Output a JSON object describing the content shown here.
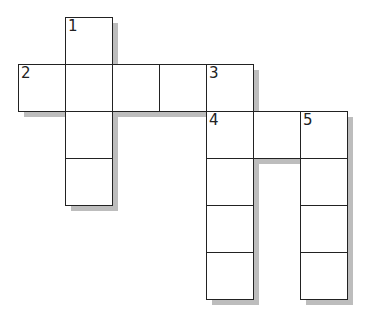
{
  "puzzle": {
    "type": "crossword",
    "cell_size": 47,
    "origin": {
      "x": 18,
      "y": 17
    },
    "colors": {
      "border": "#222222",
      "shadow": "#bdbdbd",
      "cell": "#ffffff"
    },
    "cells": [
      {
        "col": 1,
        "row": 0,
        "number": "1"
      },
      {
        "col": 0,
        "row": 1,
        "number": "2"
      },
      {
        "col": 1,
        "row": 1,
        "number": ""
      },
      {
        "col": 2,
        "row": 1,
        "number": ""
      },
      {
        "col": 3,
        "row": 1,
        "number": ""
      },
      {
        "col": 4,
        "row": 1,
        "number": "3"
      },
      {
        "col": 1,
        "row": 2,
        "number": ""
      },
      {
        "col": 1,
        "row": 3,
        "number": ""
      },
      {
        "col": 4,
        "row": 2,
        "number": "4"
      },
      {
        "col": 5,
        "row": 2,
        "number": ""
      },
      {
        "col": 6,
        "row": 2,
        "number": "5"
      },
      {
        "col": 4,
        "row": 3,
        "number": ""
      },
      {
        "col": 4,
        "row": 4,
        "number": ""
      },
      {
        "col": 4,
        "row": 5,
        "number": ""
      },
      {
        "col": 6,
        "row": 3,
        "number": ""
      },
      {
        "col": 6,
        "row": 4,
        "number": ""
      },
      {
        "col": 6,
        "row": 5,
        "number": ""
      }
    ]
  }
}
